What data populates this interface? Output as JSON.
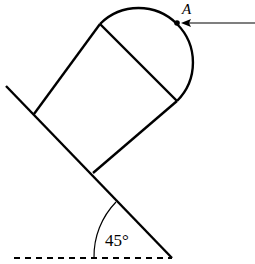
{
  "diagram": {
    "point_label": "A",
    "angle_label": "45°",
    "colors": {
      "stroke": "#000000",
      "background": "#ffffff"
    }
  }
}
